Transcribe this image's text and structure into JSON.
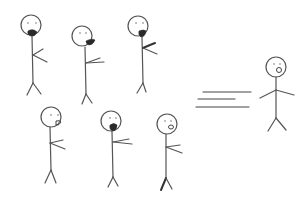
{
  "diagram": {
    "stroke_color": "#555555",
    "background": "#ffffff",
    "crowd": [
      {
        "id": "figure-1",
        "head": [
          31,
          25,
          9
        ],
        "mouth": "beard-open",
        "arm_dir": "right"
      },
      {
        "id": "figure-2",
        "head": [
          82,
          38,
          9
        ],
        "mouth": "open",
        "arm_dir": "right"
      },
      {
        "id": "figure-3",
        "head": [
          138,
          26,
          9
        ],
        "mouth": "open",
        "arm_dir": "right"
      },
      {
        "id": "figure-4",
        "head": [
          50,
          117,
          9
        ],
        "mouth": "grin",
        "arm_dir": "right"
      },
      {
        "id": "figure-5",
        "head": [
          110,
          121,
          9
        ],
        "mouth": "open",
        "arm_dir": "right"
      },
      {
        "id": "figure-6",
        "head": [
          166,
          124,
          9
        ],
        "mouth": "small-o",
        "arm_dir": "right"
      }
    ],
    "speed_lines": [
      {
        "x1": 203,
        "y1": 92,
        "x2": 251,
        "y2": 92
      },
      {
        "x1": 198,
        "y1": 99,
        "x2": 235,
        "y2": 99
      },
      {
        "x1": 196,
        "y1": 107,
        "x2": 249,
        "y2": 107
      }
    ],
    "lone_figure": {
      "id": "figure-right",
      "head": [
        275,
        67,
        9
      ],
      "mouth": "small-o",
      "arms": "spread"
    }
  }
}
